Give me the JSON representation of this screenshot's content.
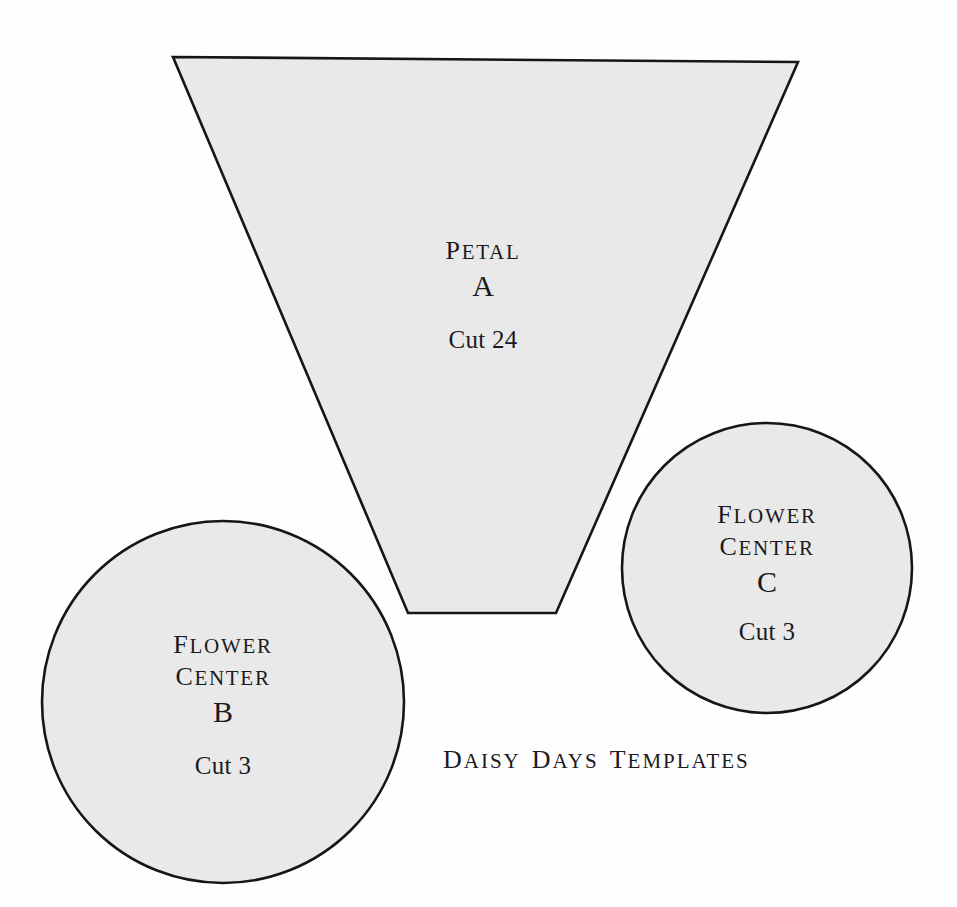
{
  "document": {
    "caption": "DAISY DAYS TEMPLATES",
    "caption_words": [
      "DAISY",
      "DAYS",
      "TEMPLATES"
    ],
    "background_color": "#fefefe",
    "piece_fill_color": "#e9e9e9",
    "outline_color": "#16161a",
    "text_color": "#1a1a1f"
  },
  "pieces": [
    {
      "id": "A",
      "shape": "trapezoid",
      "name_line_1": "PETAL",
      "name_line_2": "",
      "letter": "A",
      "cut_label": "Cut 24",
      "cut_quantity": 24
    },
    {
      "id": "B",
      "shape": "circle",
      "name_line_1": "FLOWER",
      "name_line_2": "CENTER",
      "letter": "B",
      "cut_label": "Cut 3",
      "cut_quantity": 3
    },
    {
      "id": "C",
      "shape": "circle",
      "name_line_1": "FLOWER",
      "name_line_2": "CENTER",
      "letter": "C",
      "cut_label": "Cut 3",
      "cut_quantity": 3
    }
  ]
}
